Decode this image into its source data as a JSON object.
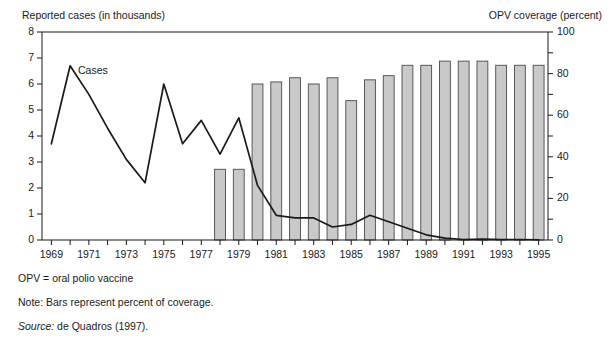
{
  "axes": {
    "left_title": "Reported cases (in thousands)",
    "right_title": "OPV coverage (percent)",
    "left_ticks": [
      "8",
      "7",
      "6",
      "5",
      "4",
      "3",
      "2",
      "1",
      "0"
    ],
    "right_ticks": [
      "100",
      "80",
      "60",
      "40",
      "20",
      "0"
    ],
    "x_ticks": [
      "1969",
      "1971",
      "1973",
      "1975",
      "1977",
      "1979",
      "1981",
      "1983",
      "1985",
      "1987",
      "1989",
      "1991",
      "1993",
      "1995"
    ]
  },
  "series_label": "Cases",
  "notes": [
    "OPV = oral polio vaccine",
    "Note: Bars represent percent of coverage.",
    "Source: de Quadros (1997)."
  ],
  "source_italic_word": "Source:",
  "source_rest": " de Quadros (1997).",
  "colors": {
    "bar_fill": "#c9c9c9",
    "bar_stroke": "#4a4a4a",
    "line": "#1a1a1a",
    "axis": "#1a1a1a",
    "text": "#1a1a1a"
  },
  "chart_data": {
    "type": "bar",
    "title": "",
    "xlabel": "",
    "ylabel": "Reported cases (in thousands)",
    "y2label": "OPV coverage (percent)",
    "ylim": [
      0,
      8
    ],
    "y2lim": [
      0,
      100
    ],
    "grid": false,
    "legend": "inline-annotation",
    "x": [
      1969,
      1970,
      1971,
      1972,
      1973,
      1974,
      1975,
      1976,
      1977,
      1978,
      1979,
      1980,
      1981,
      1982,
      1983,
      1984,
      1985,
      1986,
      1987,
      1988,
      1989,
      1990,
      1991,
      1992,
      1993,
      1994,
      1995
    ],
    "series": [
      {
        "name": "Cases",
        "type": "line",
        "axis": "left",
        "unit": "thousands of reported cases",
        "values": [
          3.7,
          6.7,
          5.6,
          4.3,
          3.1,
          2.2,
          6.0,
          3.7,
          4.6,
          3.3,
          4.7,
          2.1,
          0.95,
          0.85,
          0.85,
          0.5,
          0.6,
          0.95,
          0.7,
          0.45,
          0.2,
          0.07,
          0.02,
          0.03,
          0.02,
          0.02,
          0.01
        ]
      },
      {
        "name": "OPV coverage",
        "type": "bar",
        "axis": "right",
        "unit": "percent",
        "values": [
          null,
          null,
          null,
          null,
          null,
          null,
          null,
          null,
          null,
          34,
          34,
          75,
          76,
          78,
          75,
          78,
          67,
          77,
          79,
          84,
          84,
          86,
          86,
          86,
          84,
          84,
          84
        ]
      }
    ]
  }
}
